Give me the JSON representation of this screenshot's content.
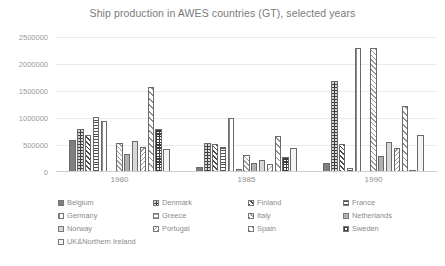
{
  "chart_data": {
    "type": "bar",
    "title": "Ship production in AWES countries (GT), selected years",
    "xlabel": "",
    "ylabel": "",
    "categories": [
      "1980",
      "1985",
      "1990"
    ],
    "ylim": [
      0,
      2500000
    ],
    "ytick_labels": [
      "0",
      "500000",
      "1000000",
      "1500000",
      "2000000",
      "2500000"
    ],
    "yticks": [
      0,
      500000,
      1000000,
      1500000,
      2000000,
      2500000
    ],
    "grid": true,
    "legend_position": "bottom",
    "series": [
      {
        "name": "Belgium",
        "pattern": "solid-gray",
        "values": [
          600000,
          90000,
          160000
        ]
      },
      {
        "name": "Denmark",
        "pattern": "dots-dark",
        "values": [
          790000,
          545000,
          1680000
        ]
      },
      {
        "name": "Finland",
        "pattern": "diag-dark",
        "values": [
          690000,
          510000,
          510000
        ]
      },
      {
        "name": "France",
        "pattern": "hlines-dark",
        "values": [
          1010000,
          470000,
          80000
        ]
      },
      {
        "name": "Germany",
        "pattern": "vlines",
        "values": [
          950000,
          1000000,
          2300000
        ]
      },
      {
        "name": "Greece",
        "pattern": "hlines-light",
        "values": [
          0,
          60000,
          10000
        ]
      },
      {
        "name": "Italy",
        "pattern": "diag-light",
        "values": [
          530000,
          320000,
          2300000
        ]
      },
      {
        "name": "Netherlands",
        "pattern": "solid-mid",
        "values": [
          330000,
          170000,
          300000
        ]
      },
      {
        "name": "Norway",
        "pattern": "solid-light",
        "values": [
          570000,
          230000,
          550000
        ]
      },
      {
        "name": "Portugal",
        "pattern": "diag-back",
        "values": [
          460000,
          150000,
          450000
        ]
      },
      {
        "name": "Spain",
        "pattern": "diag-wide",
        "values": [
          1580000,
          670000,
          1220000
        ]
      },
      {
        "name": "Sweden",
        "pattern": "check",
        "values": [
          790000,
          270000,
          30000
        ]
      },
      {
        "name": "UK&Northern Ireland",
        "pattern": "plain-white",
        "values": [
          430000,
          440000,
          690000
        ]
      }
    ]
  }
}
